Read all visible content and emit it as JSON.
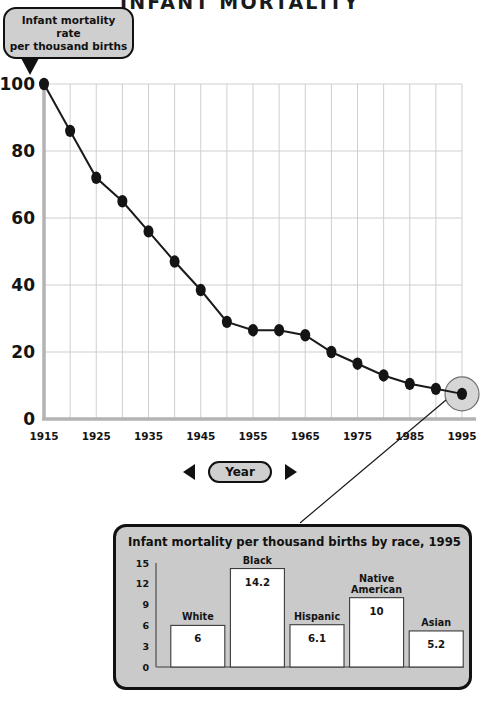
{
  "title": "INFANT MORTALITY",
  "callout": {
    "line1": "Infant mortality rate",
    "line2": "per thousand births",
    "pointer_icon": "down-triangle-icon"
  },
  "year_stepper": {
    "prev_icon": "left-triangle-icon",
    "next_icon": "right-triangle-icon",
    "label": "Year"
  },
  "inset": {
    "title": "Infant mortality per thousand births by race, 1995"
  },
  "colors": {
    "background": "#ffffff",
    "ink": "#111111",
    "grid": "#cfcfcf",
    "axis": "#b3b3b3",
    "panel_fill": "#cacaca",
    "bubble_fill": "#cfcfcf",
    "marker": "#141414",
    "highlight_fill": "#d6d6d6",
    "bar_fill": "#ffffff"
  },
  "chart_data": [
    {
      "type": "line",
      "title": "INFANT MORTALITY",
      "xlabel": "Year",
      "ylabel": "Infant mortality rate per thousand births",
      "xlim": [
        1915,
        1995
      ],
      "ylim": [
        0,
        100
      ],
      "yticks": [
        0,
        20,
        40,
        60,
        80,
        100
      ],
      "xticks": [
        1915,
        1925,
        1935,
        1945,
        1955,
        1965,
        1975,
        1985,
        1995
      ],
      "grid": true,
      "legend": "none",
      "x": [
        1915,
        1920,
        1925,
        1930,
        1935,
        1940,
        1945,
        1950,
        1955,
        1960,
        1965,
        1970,
        1975,
        1980,
        1985,
        1990,
        1995
      ],
      "values": [
        100,
        86,
        72,
        65,
        56,
        47,
        38.5,
        29,
        26.5,
        26.5,
        25,
        20,
        16.5,
        13,
        10.5,
        9,
        7.5
      ],
      "highlight": {
        "x": 1995,
        "y": 7.5,
        "label": "selected-year-marker"
      }
    },
    {
      "type": "bar",
      "title": "Infant mortality per thousand births by race, 1995",
      "xlabel": "",
      "ylabel": "",
      "ylim": [
        0,
        15
      ],
      "yticks": [
        0,
        3,
        6,
        9,
        12,
        15
      ],
      "grid": false,
      "legend": "none",
      "categories": [
        "White",
        "Black",
        "Hispanic",
        "Native American",
        "Asian"
      ],
      "values": [
        6,
        14.2,
        6.1,
        10,
        5.2
      ],
      "value_labels": [
        "6",
        "14.2",
        "6.1",
        "10",
        "5.2"
      ]
    }
  ]
}
